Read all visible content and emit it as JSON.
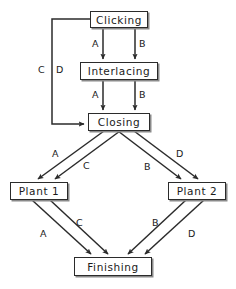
{
  "diagram": {
    "type": "flowchart",
    "background": "#ffffff",
    "line_color": "#2b2b2b",
    "box_fill": "#ffffff",
    "nodes": [
      {
        "id": "clicking",
        "label": "Clicking",
        "x": 90,
        "y": 11,
        "w": 58,
        "h": 17
      },
      {
        "id": "interlacing",
        "label": "Interlacing",
        "x": 80,
        "y": 62,
        "w": 78,
        "h": 18
      },
      {
        "id": "closing",
        "label": "Closing",
        "x": 88,
        "y": 113,
        "w": 62,
        "h": 18
      },
      {
        "id": "plant1",
        "label": "Plant 1",
        "x": 10,
        "y": 182,
        "w": 58,
        "h": 18
      },
      {
        "id": "plant2",
        "label": "Plant 2",
        "x": 168,
        "y": 182,
        "w": 58,
        "h": 18
      },
      {
        "id": "finishing",
        "label": "Finishing",
        "x": 74,
        "y": 257,
        "w": 78,
        "h": 19
      }
    ],
    "edges": [
      {
        "id": "e1",
        "from": "clicking",
        "to": "interlacing",
        "label": "A"
      },
      {
        "id": "e2",
        "from": "clicking",
        "to": "interlacing",
        "label": "B"
      },
      {
        "id": "e3",
        "from": "interlacing",
        "to": "closing",
        "label": "A"
      },
      {
        "id": "e4",
        "from": "interlacing",
        "to": "closing",
        "label": "B"
      },
      {
        "id": "e5",
        "from": "clicking",
        "to": "closing",
        "label": "C"
      },
      {
        "id": "e6",
        "from": "clicking",
        "to": "closing",
        "label": "D"
      },
      {
        "id": "e7",
        "from": "closing",
        "to": "plant1",
        "label": "A"
      },
      {
        "id": "e8",
        "from": "closing",
        "to": "plant1",
        "label": "C"
      },
      {
        "id": "e9",
        "from": "closing",
        "to": "plant2",
        "label": "B"
      },
      {
        "id": "e10",
        "from": "closing",
        "to": "plant2",
        "label": "D"
      },
      {
        "id": "e11",
        "from": "plant1",
        "to": "finishing",
        "label": "A"
      },
      {
        "id": "e12",
        "from": "plant1",
        "to": "finishing",
        "label": "C"
      },
      {
        "id": "e13",
        "from": "plant2",
        "to": "finishing",
        "label": "B"
      },
      {
        "id": "e14",
        "from": "plant2",
        "to": "finishing",
        "label": "D"
      }
    ],
    "edge_labels": {
      "click_interlace_a": "A",
      "click_interlace_b": "B",
      "interlace_close_a": "A",
      "interlace_close_b": "B",
      "bypass_c": "C",
      "bypass_d": "D",
      "close_plant1_a": "A",
      "close_plant1_c": "C",
      "close_plant2_b": "B",
      "close_plant2_d": "D",
      "plant1_fin_a": "A",
      "plant1_fin_c": "C",
      "plant2_fin_b": "B",
      "plant2_fin_d": "D"
    }
  }
}
